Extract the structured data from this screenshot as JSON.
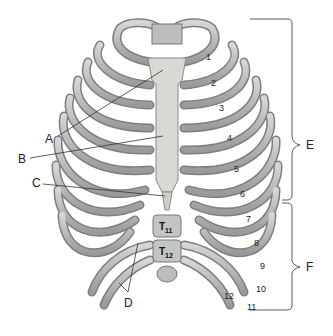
{
  "diagram": {
    "colors": {
      "bone": "#c9c9c9",
      "bone_shadow": "#8f8f8f",
      "cartilage": "#dcdcd6",
      "line": "#333333"
    },
    "labels": {
      "A": "A",
      "B": "B",
      "C": "C",
      "D": "D",
      "E": "E",
      "F": "F"
    },
    "rib_numbers": [
      "1",
      "2",
      "3",
      "4",
      "5",
      "6",
      "7",
      "8",
      "9",
      "10",
      "11",
      "12"
    ],
    "vertebrae": [
      {
        "main": "T",
        "sub": "11"
      },
      {
        "main": "T",
        "sub": "12"
      }
    ]
  }
}
